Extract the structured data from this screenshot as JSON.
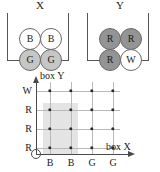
{
  "figure": {
    "type": "sample-space-grid",
    "boxes": [
      {
        "title": "X",
        "name": "box-x",
        "balls": [
          {
            "label": "B",
            "fill": "white",
            "row": 0,
            "col": 0
          },
          {
            "label": "B",
            "fill": "white",
            "row": 0,
            "col": 1
          },
          {
            "label": "G",
            "fill": "gray",
            "row": 1,
            "col": 0
          },
          {
            "label": "G",
            "fill": "gray",
            "row": 1,
            "col": 1
          }
        ]
      },
      {
        "title": "Y",
        "name": "box-y",
        "balls": [
          {
            "label": "R",
            "fill": "dgray",
            "row": 0,
            "col": 0
          },
          {
            "label": "R",
            "fill": "dgray",
            "row": 0,
            "col": 1
          },
          {
            "label": "R",
            "fill": "dgray",
            "row": 1,
            "col": 0
          },
          {
            "label": "W",
            "fill": "white",
            "row": 1,
            "col": 1
          }
        ]
      }
    ]
  },
  "chart_data": {
    "type": "scatter",
    "title": "",
    "xlabel": "box X",
    "ylabel": "box Y",
    "categories": [
      "B",
      "B",
      "G",
      "G"
    ],
    "y_categories": [
      "W",
      "R",
      "R",
      "R"
    ],
    "x_tick_labels": [
      "B",
      "B",
      "G",
      "G"
    ],
    "y_tick_labels_top_to_bottom": [
      "W",
      "R",
      "R",
      "R"
    ],
    "grid": true,
    "legend": "none",
    "origin_marker": "circle",
    "points": [
      {
        "x": "B",
        "y": "W",
        "xi": 0,
        "yi": 3
      },
      {
        "x": "B",
        "y": "W",
        "xi": 1,
        "yi": 3
      },
      {
        "x": "G",
        "y": "W",
        "xi": 2,
        "yi": 3
      },
      {
        "x": "G",
        "y": "W",
        "xi": 3,
        "yi": 3
      },
      {
        "x": "B",
        "y": "R",
        "xi": 0,
        "yi": 2
      },
      {
        "x": "B",
        "y": "R",
        "xi": 1,
        "yi": 2
      },
      {
        "x": "G",
        "y": "R",
        "xi": 2,
        "yi": 2
      },
      {
        "x": "G",
        "y": "R",
        "xi": 3,
        "yi": 2
      },
      {
        "x": "B",
        "y": "R",
        "xi": 0,
        "yi": 1
      },
      {
        "x": "B",
        "y": "R",
        "xi": 1,
        "yi": 1
      },
      {
        "x": "G",
        "y": "R",
        "xi": 2,
        "yi": 1
      },
      {
        "x": "G",
        "y": "R",
        "xi": 3,
        "yi": 1
      },
      {
        "x": "B",
        "y": "R",
        "xi": 0,
        "yi": 0
      },
      {
        "x": "B",
        "y": "R",
        "xi": 1,
        "yi": 0
      },
      {
        "x": "G",
        "y": "R",
        "xi": 2,
        "yi": 0
      },
      {
        "x": "G",
        "y": "R",
        "xi": 3,
        "yi": 0
      }
    ],
    "highlight_region": {
      "description": "shaded rectangle over x = B,B and y = R,R,R",
      "x_from": 0,
      "x_to": 1,
      "y_from": 0,
      "y_to": 2,
      "fill": "#d9d9d9"
    },
    "colors": {
      "dot": "#2a2a2a",
      "gridline": "#b9b9b9",
      "axis": "#4a4a4a",
      "shade": "#d9d9d9"
    }
  }
}
